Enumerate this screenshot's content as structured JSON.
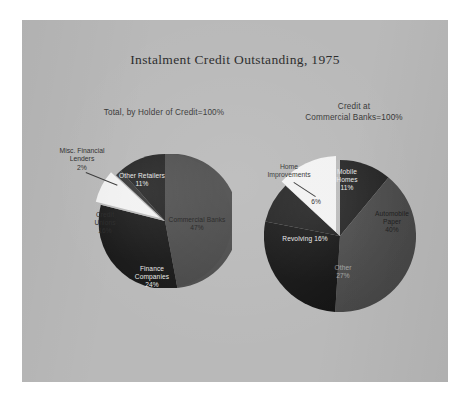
{
  "figure": {
    "title": "Instalment Credit Outstanding, 1975",
    "background_color": "#b9b9b9",
    "page_color": "#ffffff"
  },
  "left_chart": {
    "subtitle": "Total, by Holder of Credit=100%",
    "callouts": {
      "misc_lenders": "Misc. Financial\nLenders\n2%"
    }
  },
  "right_chart": {
    "subtitle_line1": "Credit at",
    "subtitle_line2": "Commercial Banks=100%",
    "callouts": {
      "home_improvements": "Home\nImprovements",
      "home_improvements_pct": "6%"
    }
  },
  "chart_data": [
    {
      "type": "pie",
      "title": "Total, by Holder of Credit=100%",
      "labels": [
        "Commercial Banks",
        "Finance Companies",
        "Credit Unions",
        "Other Retailers",
        "Misc. Financial Lenders"
      ],
      "values": [
        47,
        24,
        16,
        11,
        2
      ],
      "value_labels": [
        "47%",
        "24%",
        "16%",
        "11%",
        "2%"
      ],
      "colors": [
        "#4a4a4a",
        "#171717",
        "#f2f2f2",
        "#1f1f1f",
        "#303030"
      ],
      "exploded": [
        "Credit Unions"
      ],
      "legend": "none",
      "total_label": "100%"
    },
    {
      "type": "pie",
      "title": "Credit at Commercial Banks=100%",
      "labels": [
        "Automobile Paper",
        "Other",
        "Revolving",
        "Mobile Homes",
        "Home Improvements"
      ],
      "values": [
        40,
        27,
        16,
        11,
        6
      ],
      "value_labels": [
        "40%",
        "27%",
        "16%",
        "11%",
        "6%"
      ],
      "colors": [
        "#4a4a4a",
        "#141414",
        "#1d1d1d",
        "#232323",
        "#f2f2f2"
      ],
      "exploded": [
        "Home Improvements"
      ],
      "legend": "none",
      "total_label": "100%"
    }
  ],
  "slice_text": {
    "left": {
      "commercial_banks": "Commercial Banks\n47%",
      "other_retailers": "Other Retailers\n11%",
      "credit_unions": "Credit\nUnions\n16%",
      "finance_companies": "Finance\nCompanies\n24%"
    },
    "right": {
      "mobile_homes": "Mobile\nHomes\n11%",
      "automobile_paper": "Automobile\nPaper\n40%",
      "revolving": "Revolving 16%",
      "other": "Other\n27%"
    }
  }
}
